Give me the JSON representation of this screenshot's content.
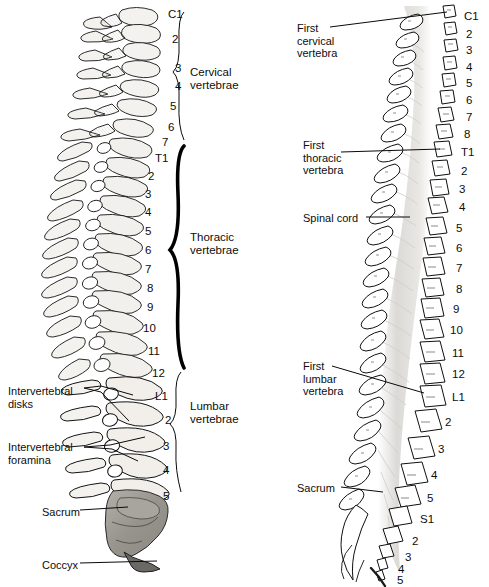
{
  "figure": {
    "panels": [
      {
        "id": "left",
        "name": "lateral-view"
      },
      {
        "id": "right",
        "name": "posterior-view"
      }
    ]
  },
  "colors": {
    "ink": "#0d0d0d",
    "bone_fill": "#f2f0ec",
    "bone_shade": "#d9d6d0",
    "sacrum_fill": "#9a9892",
    "cord_fill": "#dedcd8",
    "paper": "#ffffff"
  },
  "left_panel": {
    "name": "lateral-spine-view",
    "vertebra_numbers": [
      {
        "label": "C1",
        "x": 168,
        "y": 8
      },
      {
        "label": "2",
        "x": 172,
        "y": 33
      },
      {
        "label": "3",
        "x": 175,
        "y": 62
      },
      {
        "label": "4",
        "x": 175,
        "y": 80
      },
      {
        "label": "5",
        "x": 170,
        "y": 100
      },
      {
        "label": "6",
        "x": 168,
        "y": 121
      },
      {
        "label": "7",
        "x": 162,
        "y": 136
      },
      {
        "label": "T1",
        "x": 155,
        "y": 152
      },
      {
        "label": "2",
        "x": 148,
        "y": 170
      },
      {
        "label": "3",
        "x": 145,
        "y": 188
      },
      {
        "label": "4",
        "x": 145,
        "y": 206
      },
      {
        "label": "5",
        "x": 145,
        "y": 225
      },
      {
        "label": "6",
        "x": 145,
        "y": 244
      },
      {
        "label": "7",
        "x": 145,
        "y": 263
      },
      {
        "label": "8",
        "x": 147,
        "y": 282
      },
      {
        "label": "9",
        "x": 147,
        "y": 301
      },
      {
        "label": "10",
        "x": 143,
        "y": 322
      },
      {
        "label": "11",
        "x": 148,
        "y": 345
      },
      {
        "label": "12",
        "x": 152,
        "y": 367
      },
      {
        "label": "L1",
        "x": 155,
        "y": 390
      },
      {
        "label": "2",
        "x": 165,
        "y": 414
      },
      {
        "label": "3",
        "x": 163,
        "y": 440
      },
      {
        "label": "4",
        "x": 163,
        "y": 464
      },
      {
        "label": "5",
        "x": 163,
        "y": 490
      }
    ],
    "groups": [
      {
        "name": "cervical-group",
        "label": "Cervical\nvertebrae",
        "x": 190,
        "y": 66,
        "brace_top": 12,
        "brace_bottom": 140,
        "brace_x": 184,
        "thick": false
      },
      {
        "name": "thoracic-group",
        "label": "Thoracic\nvertebrae",
        "x": 190,
        "y": 231,
        "brace_top": 146,
        "brace_bottom": 368,
        "brace_x": 184,
        "thick": true
      },
      {
        "name": "lumbar-group",
        "label": "Lumbar\nvertebrae",
        "x": 190,
        "y": 400,
        "brace_top": 372,
        "brace_bottom": 492,
        "brace_x": 181,
        "thick": false
      }
    ],
    "callouts": [
      {
        "name": "intervertebral-disks",
        "label": "Intervertebral\ndisks",
        "x": 8,
        "y": 385
      },
      {
        "name": "intervertebral-foramina",
        "label": "Intervertebral\nforamina",
        "x": 8,
        "y": 441
      },
      {
        "name": "sacrum",
        "label": "Sacrum",
        "x": 42,
        "y": 506
      },
      {
        "name": "coccyx",
        "label": "Coccyx",
        "x": 42,
        "y": 559
      }
    ]
  },
  "right_panel": {
    "name": "posterior-spine-view",
    "vertebra_numbers": [
      {
        "label": "C1",
        "x": 464,
        "y": 10
      },
      {
        "label": "2",
        "x": 466,
        "y": 28
      },
      {
        "label": "3",
        "x": 466,
        "y": 44
      },
      {
        "label": "4",
        "x": 466,
        "y": 61
      },
      {
        "label": "5",
        "x": 466,
        "y": 77
      },
      {
        "label": "6",
        "x": 466,
        "y": 94
      },
      {
        "label": "7",
        "x": 466,
        "y": 111
      },
      {
        "label": "8",
        "x": 464,
        "y": 128
      },
      {
        "label": "T1",
        "x": 461,
        "y": 146
      },
      {
        "label": "2",
        "x": 461,
        "y": 165
      },
      {
        "label": "3",
        "x": 459,
        "y": 183
      },
      {
        "label": "4",
        "x": 459,
        "y": 201
      },
      {
        "label": "5",
        "x": 456,
        "y": 222
      },
      {
        "label": "6",
        "x": 456,
        "y": 242
      },
      {
        "label": "7",
        "x": 456,
        "y": 262
      },
      {
        "label": "8",
        "x": 456,
        "y": 283
      },
      {
        "label": "9",
        "x": 453,
        "y": 303
      },
      {
        "label": "10",
        "x": 450,
        "y": 324
      },
      {
        "label": "11",
        "x": 452,
        "y": 347
      },
      {
        "label": "12",
        "x": 452,
        "y": 368
      },
      {
        "label": "L1",
        "x": 452,
        "y": 391
      },
      {
        "label": "2",
        "x": 445,
        "y": 416
      },
      {
        "label": "3",
        "x": 438,
        "y": 443
      },
      {
        "label": "4",
        "x": 431,
        "y": 469
      },
      {
        "label": "5",
        "x": 427,
        "y": 492
      },
      {
        "label": "S1",
        "x": 420,
        "y": 513
      },
      {
        "label": "2",
        "x": 412,
        "y": 535
      },
      {
        "label": "3",
        "x": 405,
        "y": 551
      },
      {
        "label": "4",
        "x": 398,
        "y": 563
      },
      {
        "label": "5",
        "x": 397,
        "y": 574
      }
    ],
    "callouts": [
      {
        "name": "first-cervical-vertebra",
        "label": "First\ncervical\nvertebra",
        "x": 297,
        "y": 22
      },
      {
        "name": "first-thoracic-vertebra",
        "label": "First\nthoracic\nvertebra",
        "x": 303,
        "y": 139
      },
      {
        "name": "spinal-cord",
        "label": "Spinal cord",
        "x": 303,
        "y": 212
      },
      {
        "name": "first-lumbar-vertebra",
        "label": "First\nlumbar\nvertebra",
        "x": 303,
        "y": 360
      },
      {
        "name": "sacrum",
        "label": "Sacrum",
        "x": 297,
        "y": 482
      }
    ]
  }
}
